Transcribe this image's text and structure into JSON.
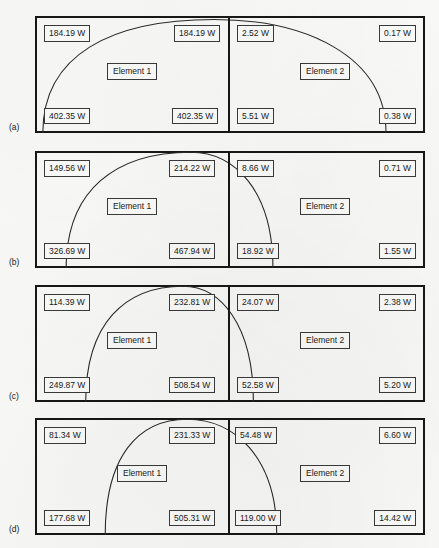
{
  "figure": {
    "unit": "W",
    "element_labels": {
      "left": "Element 1",
      "right": "Element 2"
    },
    "stroke_color": "#171717",
    "arc_color": "#2a2a2a",
    "box_border_color": "#3a3a3a",
    "background": "#fbfbfa"
  },
  "panels": [
    {
      "tag": "(a)",
      "element1": {
        "label": "Element 1",
        "top_left": "184.19 W",
        "top_right": "184.19 W",
        "bottom_left": "402.35 W",
        "bottom_right": "402.35 W"
      },
      "element2": {
        "label": "Element 2",
        "top_left": "2.52 W",
        "top_right": "0.17 W",
        "bottom_left": "5.51 W",
        "bottom_right": "0.38 W"
      },
      "arc": {
        "left_foot_pct": 2,
        "apex_pct": 46,
        "right_foot_pct": 90,
        "apex_height_pct": 97
      }
    },
    {
      "tag": "(b)",
      "element1": {
        "label": "Element 1",
        "top_left": "149.56 W",
        "top_right": "214.22 W",
        "bottom_left": "326.69 W",
        "bottom_right": "467.94 W"
      },
      "element2": {
        "label": "Element 2",
        "top_left": "8.66 W",
        "top_right": "0.71 W",
        "bottom_left": "18.92 W",
        "bottom_right": "1.55 W"
      },
      "arc": {
        "left_foot_pct": 8,
        "apex_pct": 40,
        "right_foot_pct": 61,
        "apex_height_pct": 99
      }
    },
    {
      "tag": "(c)",
      "element1": {
        "label": "Element 1",
        "top_left": "114.39 W",
        "top_right": "232.81 W",
        "bottom_left": "249.87 W",
        "bottom_right": "508.54 W"
      },
      "element2": {
        "label": "Element 2",
        "top_left": "24.07 W",
        "top_right": "2.38 W",
        "bottom_left": "52.58 W",
        "bottom_right": "5.20 W"
      },
      "arc": {
        "left_foot_pct": 13,
        "apex_pct": 38,
        "right_foot_pct": 56,
        "apex_height_pct": 99
      }
    },
    {
      "tag": "(d)",
      "element1": {
        "label": "Element 1",
        "top_left": "81.34 W",
        "top_right": "231.33 W",
        "bottom_left": "177.68 W",
        "bottom_right": "505.31 W"
      },
      "element2": {
        "label": "Element 2",
        "top_left": "54.48 W",
        "top_right": "6.60 W",
        "bottom_left": "119.00 W",
        "bottom_right": "14.42 W"
      },
      "arc": {
        "left_foot_pct": 18,
        "apex_pct": 39,
        "right_foot_pct": 62,
        "apex_height_pct": 99
      }
    }
  ]
}
